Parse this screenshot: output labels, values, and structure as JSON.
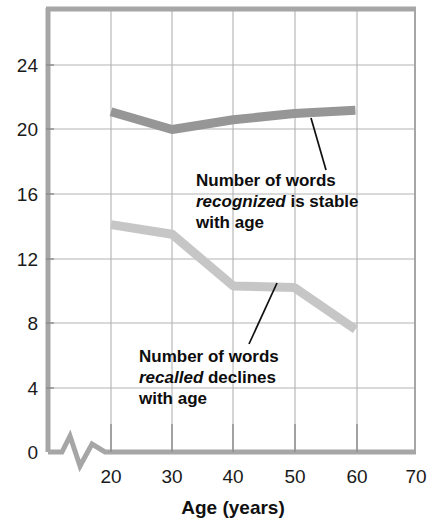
{
  "chart_data": {
    "type": "line",
    "title": "",
    "xlabel": "Age (years)",
    "ylabel": "",
    "xlim": [
      15,
      70
    ],
    "ylim": [
      0,
      26
    ],
    "xticks": [
      20,
      30,
      40,
      50,
      60,
      70
    ],
    "yticks": [
      0,
      4,
      8,
      12,
      16,
      20,
      24
    ],
    "xtick_labels": [
      "20",
      "30",
      "40",
      "50",
      "60",
      "70"
    ],
    "ytick_labels": [
      "0",
      "4",
      "8",
      "12",
      "16",
      "20",
      "24"
    ],
    "grid": true,
    "legend_position": "none",
    "axis_break": true,
    "x": [
      20,
      30,
      40,
      50,
      60
    ],
    "series": [
      {
        "name": "Number of words recognized",
        "color": "#969696",
        "values": [
          21.1,
          20.0,
          20.6,
          21.0,
          21.2
        ]
      },
      {
        "name": "Number of words recalled",
        "color": "#c6c6c6",
        "values": [
          14.1,
          13.5,
          10.3,
          10.2,
          7.6
        ]
      }
    ],
    "annotations": [
      {
        "id": "recognized",
        "lines": [
          {
            "pre": "Number of words",
            "em": "",
            "post": ""
          },
          {
            "pre": "",
            "em": "recognized",
            "post": " is stable"
          },
          {
            "pre": "with age",
            "em": "",
            "post": ""
          }
        ],
        "target_x": 52,
        "target_y": 21.0
      },
      {
        "id": "recalled",
        "lines": [
          {
            "pre": "Number of words",
            "em": "",
            "post": ""
          },
          {
            "pre": "",
            "em": "recalled",
            "post": " declines"
          },
          {
            "pre": "with age",
            "em": "",
            "post": ""
          }
        ],
        "target_x": 46,
        "target_y": 10.3
      }
    ]
  },
  "colors": {
    "grid": "#b3b3b3",
    "frame": "#a6a6a6",
    "recognized_line": "#969696",
    "recalled_line": "#c6c6c6",
    "text": "#111111",
    "leader": "#111111",
    "background": "#ffffff"
  },
  "axis": {
    "x_title": "Age (years)"
  },
  "annotation_recognized": {
    "line1": "Number of words",
    "line2_em": "recognized",
    "line2_rest": " is stable",
    "line3": "with age"
  },
  "annotation_recalled": {
    "line1": "Number of words",
    "line2_em": "recalled",
    "line2_rest": " declines",
    "line3": "with age"
  },
  "ticks": {
    "y": [
      "24",
      "20",
      "16",
      "12",
      "8",
      "4",
      "0"
    ],
    "x": [
      "20",
      "30",
      "40",
      "50",
      "60",
      "70"
    ]
  }
}
